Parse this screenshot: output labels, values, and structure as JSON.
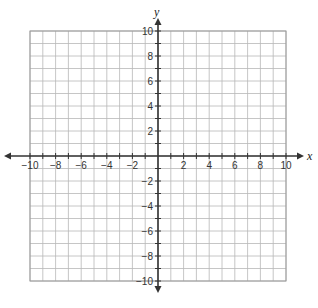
{
  "chart_data": {
    "type": "scatter",
    "title": "",
    "xlabel": "x",
    "ylabel": "y",
    "xlim": [
      -10,
      10
    ],
    "ylim": [
      -10,
      10
    ],
    "grid": true,
    "grid_step": 1,
    "x_ticks": [
      -10,
      -8,
      -6,
      -4,
      -2,
      2,
      4,
      6,
      8,
      10
    ],
    "y_ticks": [
      10,
      8,
      6,
      4,
      2,
      -2,
      -4,
      -6,
      -8,
      -10
    ],
    "points": [],
    "legend": null
  },
  "colors": {
    "grid": "#b8b8b8",
    "border": "#9a9a9a",
    "axis": "#333333"
  }
}
